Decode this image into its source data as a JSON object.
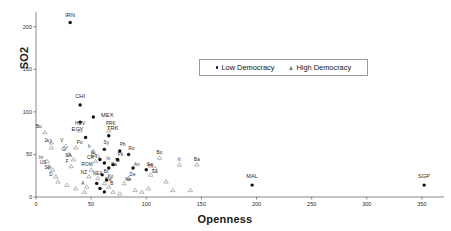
{
  "chart": {
    "type": "scatter",
    "title": "",
    "xlabel": "Openness",
    "ylabel": "SO2",
    "xlim": [
      0,
      370
    ],
    "ylim": [
      0,
      215
    ],
    "xticks": [
      0,
      50,
      100,
      150,
      200,
      250,
      300,
      350
    ],
    "yticks": [
      0,
      50,
      100,
      150,
      200
    ],
    "grid": false,
    "legend": {
      "position": "top-center-right",
      "entries": [
        {
          "label": "Low Democracy",
          "marker": "dot",
          "color": "#111111"
        },
        {
          "label": "High Democracy",
          "marker": "triangle",
          "color": "#7d7d7d"
        }
      ]
    },
    "series": [
      {
        "name": "Low Democracy",
        "marker": "dot",
        "color": "#111111",
        "points": [
          {
            "label": "IRN",
            "x": 31,
            "y": 205,
            "lx": 0,
            "ly": -8,
            "big": true
          },
          {
            "label": "CHI",
            "x": 40,
            "y": 108,
            "lx": 0,
            "ly": -9,
            "big": true
          },
          {
            "label": "",
            "x": 40,
            "y": 88,
            "lx": 0,
            "ly": 0,
            "big": false
          },
          {
            "label": "MEX",
            "x": 52,
            "y": 94,
            "lx": 14,
            "ly": -2,
            "big": true
          },
          {
            "label": "EGY",
            "x": 45,
            "y": 70,
            "lx": -8,
            "ly": -8,
            "big": true
          },
          {
            "label": "TRK",
            "x": 66,
            "y": 72,
            "lx": 4,
            "ly": -8,
            "big": true
          },
          {
            "label": "Sy",
            "x": 62,
            "y": 56,
            "lx": 2,
            "ly": -6,
            "big": false
          },
          {
            "label": "Ph",
            "x": 76,
            "y": 54,
            "lx": 3,
            "ly": -6,
            "big": false
          },
          {
            "label": "Ro",
            "x": 84,
            "y": 50,
            "lx": 3,
            "ly": -5,
            "big": false
          },
          {
            "label": "Pk",
            "x": 74,
            "y": 44,
            "lx": 3,
            "ly": -5,
            "big": false
          },
          {
            "label": "Ch",
            "x": 58,
            "y": 44,
            "lx": -6,
            "ly": -4,
            "big": false
          },
          {
            "label": "In",
            "x": 62,
            "y": 40,
            "lx": 4,
            "ly": -4,
            "big": false
          },
          {
            "label": "Ta",
            "x": 70,
            "y": 38,
            "lx": 4,
            "ly": -4,
            "big": false
          },
          {
            "label": "Ca",
            "x": 66,
            "y": 34,
            "lx": 5,
            "ly": -3,
            "big": false
          },
          {
            "label": "An",
            "x": 88,
            "y": 34,
            "lx": 4,
            "ly": -3,
            "big": false
          },
          {
            "label": "Th",
            "x": 100,
            "y": 32,
            "lx": 4,
            "ly": -3,
            "big": false
          },
          {
            "label": "Br",
            "x": 60,
            "y": 26,
            "lx": 4,
            "ly": -3,
            "big": false
          },
          {
            "label": "Ko",
            "x": 64,
            "y": 20,
            "lx": 4,
            "ly": -3,
            "big": false
          },
          {
            "label": "",
            "x": 55,
            "y": 16,
            "lx": 0,
            "ly": 0,
            "big": false
          },
          {
            "label": "",
            "x": 58,
            "y": 10,
            "lx": 0,
            "ly": 0,
            "big": false
          },
          {
            "label": "",
            "x": 62,
            "y": 6,
            "lx": 0,
            "ly": 0,
            "big": false
          },
          {
            "label": "MAL",
            "x": 196,
            "y": 14,
            "lx": 0,
            "ly": -9,
            "big": true
          },
          {
            "label": "SGP",
            "x": 352,
            "y": 14,
            "lx": 0,
            "ly": -9,
            "big": true
          }
        ]
      },
      {
        "name": "High Democracy",
        "marker": "triangle",
        "color": "#7d7d7d",
        "points": [
          {
            "label": "Bu",
            "x": 8,
            "y": 76,
            "lx": -6,
            "ly": -5,
            "big": false
          },
          {
            "label": "J",
            "x": 14,
            "y": 58,
            "lx": -1,
            "ly": -6,
            "big": false
          },
          {
            "label": "Ja",
            "x": 14,
            "y": 64,
            "lx": -5,
            "ly": -2,
            "big": false
          },
          {
            "label": "In",
            "x": 10,
            "y": 42,
            "lx": -6,
            "ly": -3,
            "big": false
          },
          {
            "label": "US",
            "x": 12,
            "y": 36,
            "lx": -6,
            "ly": -3,
            "big": false
          },
          {
            "label": "Sp",
            "x": 15,
            "y": 32,
            "lx": -5,
            "ly": -2,
            "big": false
          },
          {
            "label": "D",
            "x": 18,
            "y": 24,
            "lx": -5,
            "ly": -2,
            "big": false
          },
          {
            "label": "HUV",
            "x": 40,
            "y": 78,
            "lx": 0,
            "ly": -7,
            "big": false
          },
          {
            "label": "PRK",
            "x": 66,
            "y": 78,
            "lx": 2,
            "ly": -7,
            "big": false
          },
          {
            "label": "V",
            "x": 27,
            "y": 60,
            "lx": -4,
            "ly": -5,
            "big": false
          },
          {
            "label": "Po",
            "x": 36,
            "y": 58,
            "lx": 4,
            "ly": -5,
            "big": false
          },
          {
            "label": "Gr",
            "x": 30,
            "y": 50,
            "lx": -5,
            "ly": -4,
            "big": false
          },
          {
            "label": "SA",
            "x": 34,
            "y": 44,
            "lx": -5,
            "ly": -4,
            "big": false
          },
          {
            "label": "F",
            "x": 32,
            "y": 36,
            "lx": -4,
            "ly": -4,
            "big": false
          },
          {
            "label": "ROM",
            "x": 50,
            "y": 32,
            "lx": -4,
            "ly": -5,
            "big": false
          },
          {
            "label": "Ir",
            "x": 52,
            "y": 54,
            "lx": -4,
            "ly": -4,
            "big": false
          },
          {
            "label": "It",
            "x": 56,
            "y": 48,
            "lx": -5,
            "ly": -3,
            "big": false
          },
          {
            "label": "CR",
            "x": 54,
            "y": 42,
            "lx": -5,
            "ly": -3,
            "big": false
          },
          {
            "label": "NZ",
            "x": 48,
            "y": 24,
            "lx": -5,
            "ly": -4,
            "big": false
          },
          {
            "label": "NEA",
            "x": 56,
            "y": 22,
            "lx": 0,
            "ly": -4,
            "big": false
          },
          {
            "label": "A",
            "x": 46,
            "y": 12,
            "lx": -4,
            "ly": -3,
            "big": false
          },
          {
            "label": "Sw",
            "x": 62,
            "y": 16,
            "lx": 4,
            "ly": -3,
            "big": false
          },
          {
            "label": "B",
            "x": 66,
            "y": 12,
            "lx": 3,
            "ly": -3,
            "big": false
          },
          {
            "label": "De",
            "x": 84,
            "y": 22,
            "lx": 4,
            "ly": -3,
            "big": false
          },
          {
            "label": "Ne",
            "x": 80,
            "y": 16,
            "lx": 4,
            "ly": -3,
            "big": false
          },
          {
            "label": "Sa",
            "x": 104,
            "y": 26,
            "lx": 4,
            "ly": -3,
            "big": false
          },
          {
            "label": "Bo",
            "x": 112,
            "y": 46,
            "lx": 0,
            "ly": -5,
            "big": false
          },
          {
            "label": "Sw",
            "x": 108,
            "y": 34,
            "lx": -5,
            "ly": -3,
            "big": false
          },
          {
            "label": "Ir",
            "x": 130,
            "y": 38,
            "lx": 0,
            "ly": -5,
            "big": false
          },
          {
            "label": "Ba",
            "x": 146,
            "y": 38,
            "lx": 0,
            "ly": -5,
            "big": false
          },
          {
            "label": "",
            "x": 118,
            "y": 18,
            "lx": 0,
            "ly": 0,
            "big": false
          },
          {
            "label": "",
            "x": 90,
            "y": 8,
            "lx": 0,
            "ly": 0,
            "big": false
          },
          {
            "label": "",
            "x": 96,
            "y": 6,
            "lx": 0,
            "ly": 0,
            "big": false
          },
          {
            "label": "",
            "x": 102,
            "y": 10,
            "lx": 0,
            "ly": 0,
            "big": false
          },
          {
            "label": "",
            "x": 124,
            "y": 8,
            "lx": 0,
            "ly": 0,
            "big": false
          },
          {
            "label": "",
            "x": 140,
            "y": 8,
            "lx": 0,
            "ly": 0,
            "big": false
          },
          {
            "label": "",
            "x": 70,
            "y": 6,
            "lx": 0,
            "ly": 0,
            "big": false
          },
          {
            "label": "",
            "x": 76,
            "y": 4,
            "lx": 0,
            "ly": 0,
            "big": false
          },
          {
            "label": "",
            "x": 44,
            "y": 6,
            "lx": 0,
            "ly": 0,
            "big": false
          },
          {
            "label": "",
            "x": 36,
            "y": 10,
            "lx": 0,
            "ly": 0,
            "big": false
          },
          {
            "label": "",
            "x": 28,
            "y": 14,
            "lx": 0,
            "ly": 0,
            "big": false
          },
          {
            "label": "",
            "x": 20,
            "y": 18,
            "lx": 0,
            "ly": 0,
            "big": false
          }
        ]
      }
    ]
  }
}
